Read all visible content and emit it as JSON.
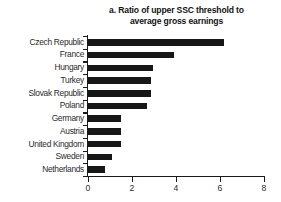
{
  "chart_data": {
    "type": "bar",
    "orientation": "horizontal",
    "title": "a. Ratio of upper SSC threshold to average gross earnings",
    "title_lines": [
      "a. Ratio of upper SSC threshold to",
      "average gross earnings"
    ],
    "xlabel": "",
    "ylabel": "",
    "categories": [
      "Czech Republic",
      "France",
      "Hungary",
      "Turkey",
      "Slovak Republic",
      "Poland",
      "Germany",
      "Austria",
      "United Kingdom",
      "Sweden",
      "Netherlands"
    ],
    "values": [
      6.2,
      3.9,
      2.95,
      2.85,
      2.85,
      2.7,
      1.5,
      1.5,
      1.5,
      1.1,
      0.75
    ],
    "xlim": [
      0,
      8
    ],
    "xticks": [
      0,
      2,
      4,
      6,
      8
    ],
    "xtick_labels": [
      "0",
      "2",
      "4",
      "6",
      "8"
    ],
    "grid": false,
    "legend": false,
    "bar_color": "#171717",
    "axis_color": "#1a1a1a",
    "background": "#ffffff"
  }
}
